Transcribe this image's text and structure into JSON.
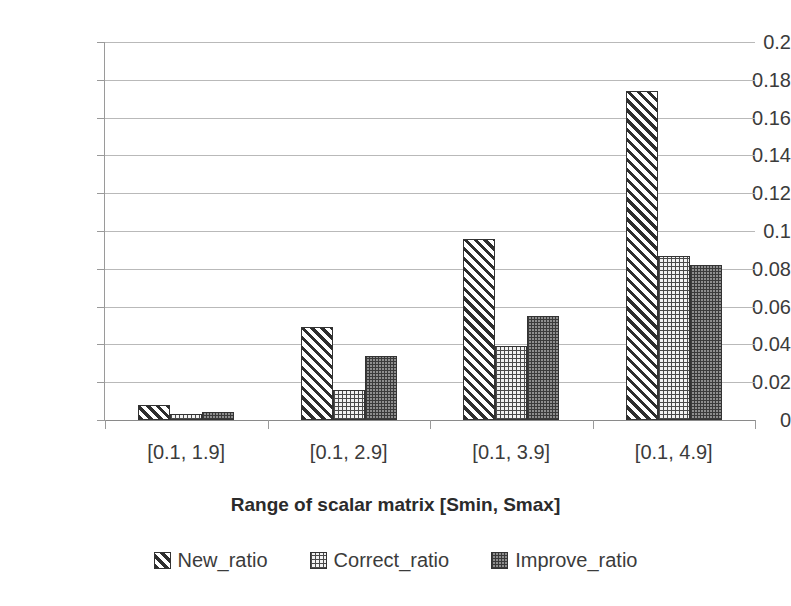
{
  "chart_data": {
    "type": "bar",
    "title": "",
    "xlabel": "Range of scalar matrix [Smin, Smax]",
    "ylabel": "",
    "categories": [
      "[0.1, 1.9]",
      "[0.1, 2.9]",
      "[0.1, 3.9]",
      "[0.1, 4.9]"
    ],
    "series": [
      {
        "name": "New_ratio",
        "values": [
          0.008,
          0.049,
          0.096,
          0.174
        ],
        "pattern": "diagonal-hatch",
        "color": "#2e2e2e"
      },
      {
        "name": "Correct_ratio",
        "values": [
          0.003,
          0.016,
          0.039,
          0.087
        ],
        "pattern": "light-dots",
        "color": "#f2f2f2"
      },
      {
        "name": "Improve_ratio",
        "values": [
          0.004,
          0.034,
          0.055,
          0.082
        ],
        "pattern": "dark-checker",
        "color": "#8e8e8e"
      }
    ],
    "ylim": [
      0,
      0.2
    ],
    "ytick_step": 0.02,
    "ytick_labels": [
      "0",
      "0.02",
      "0.04",
      "0.06",
      "0.08",
      "0.1",
      "0.12",
      "0.14",
      "0.16",
      "0.18",
      "0.2"
    ],
    "grid": "horizontal",
    "legend_position": "bottom",
    "background": "#ffffff",
    "gridline_color": "#b9b9b9",
    "axis_color": "#8a8a8a"
  },
  "legend": {
    "items": [
      {
        "label": "New_ratio"
      },
      {
        "label": "Correct_ratio"
      },
      {
        "label": "Improve_ratio"
      }
    ]
  },
  "axis": {
    "x_title": "Range of scalar matrix [Smin, Smax]"
  }
}
